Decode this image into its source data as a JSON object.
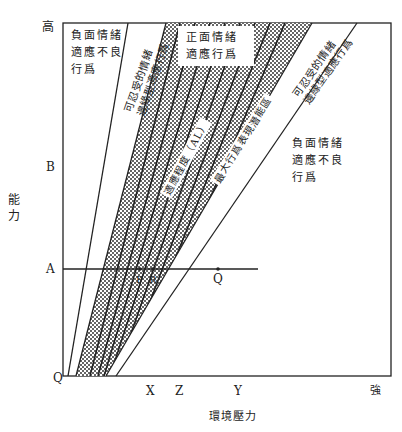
{
  "diagram": {
    "axes": {
      "y_axis_label": "能力",
      "y_top_label": "高",
      "y_ticks": [
        "B",
        "A"
      ],
      "origin_label": "Q",
      "x_axis_label": "環境壓力",
      "x_right_label": "強",
      "x_ticks": [
        "X",
        "Z",
        "Y"
      ]
    },
    "regions": {
      "top_left_negative": [
        "負面情緒",
        "適應不良",
        "行爲"
      ],
      "left_tolerable": [
        "可忍受的情緒",
        "邊緣型適應行爲"
      ],
      "center_positive": [
        "正面情緒",
        "適應行爲"
      ],
      "adaptation_level": "適應程度（AL）",
      "max_potential": "最大行爲表現潛能區",
      "right_tolerable": [
        "可忍受的情緒",
        "邊緣型適應行爲"
      ],
      "bottom_right_negative": [
        "負面情緒",
        "適應不良",
        "行爲"
      ]
    },
    "points": {
      "line_a_points": [
        "P",
        "R",
        "Q"
      ]
    },
    "colors": {
      "line": "#222222",
      "shading": "#333333",
      "background": "#ffffff"
    }
  }
}
